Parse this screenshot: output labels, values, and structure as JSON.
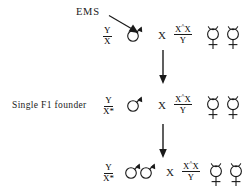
{
  "diagram": {
    "title_text": "EMS",
    "background_color": "#ffffff",
    "stroke_color": "#1a1a1a",
    "mutagen": {
      "label": "EMS",
      "arrow_name": "ems-diagonal-arrow"
    },
    "cross_operator": "X",
    "rows": [
      {
        "row_label": "",
        "parent_left": {
          "genotype_numerator": "Y",
          "genotype_denominator": "X",
          "genotype_denominator_star": "",
          "sex_symbols": [
            "male-symbol"
          ],
          "sex_count": 1
        },
        "parent_right": {
          "genotype_numerator_main": "X",
          "genotype_numerator_sup": "^",
          "genotype_numerator_tail": "X",
          "genotype_denominator": "Y",
          "sex_symbols": [
            "hermaphrodite-symbol",
            "hermaphrodite-symbol"
          ],
          "sex_count": 2
        }
      },
      {
        "row_label": "Single F1 founder",
        "parent_left": {
          "genotype_numerator": "Y",
          "genotype_denominator": "X",
          "genotype_denominator_star": "*",
          "sex_symbols": [
            "male-symbol"
          ],
          "sex_count": 1
        },
        "parent_right": {
          "genotype_numerator_main": "X",
          "genotype_numerator_sup": "^",
          "genotype_numerator_tail": "X",
          "genotype_denominator": "Y",
          "sex_symbols": [
            "hermaphrodite-symbol",
            "hermaphrodite-symbol"
          ],
          "sex_count": 2
        }
      },
      {
        "row_label": "",
        "parent_left": {
          "genotype_numerator": "Y",
          "genotype_denominator": "X",
          "genotype_denominator_star": "*",
          "sex_symbols": [
            "male-symbol",
            "male-symbol"
          ],
          "sex_count": 2
        },
        "parent_right": {
          "genotype_numerator_main": "X",
          "genotype_numerator_sup": "^",
          "genotype_numerator_tail": "X",
          "genotype_denominator": "Y",
          "sex_symbols": [
            "hermaphrodite-symbol",
            "hermaphrodite-symbol"
          ],
          "sex_count": 2
        }
      }
    ],
    "generation_arrows": [
      {
        "name": "generation-arrow-1"
      },
      {
        "name": "generation-arrow-2"
      }
    ]
  }
}
